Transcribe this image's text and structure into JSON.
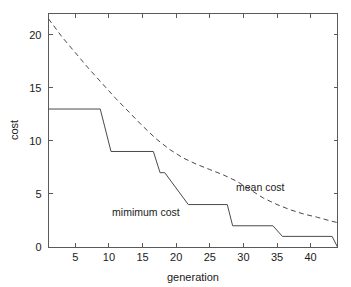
{
  "chart_data": {
    "type": "line",
    "title": "",
    "xlabel": "generation",
    "ylabel": "cost",
    "xlim": [
      1,
      44
    ],
    "ylim": [
      0,
      22
    ],
    "grid": false,
    "legend_position": "inline-annotations",
    "xticks": [
      5,
      10,
      15,
      20,
      25,
      30,
      35,
      40
    ],
    "xtick_labels": [
      "5",
      "10",
      "15",
      "20",
      "25",
      "30",
      "35",
      "40"
    ],
    "yticks": [
      0,
      5,
      10,
      15,
      20
    ],
    "ytick_labels": [
      "0",
      "5",
      "10",
      "15",
      "20"
    ],
    "series": [
      {
        "name": "mimimum cost",
        "style": "solid",
        "annotation": "mimimum cost",
        "annotation_x": 15.5,
        "annotation_y": 2.9,
        "x": [
          1,
          8.7,
          10.3,
          16.6,
          17.6,
          18.3,
          21.8,
          27.6,
          28.4,
          34.4,
          35.8,
          43.2,
          44
        ],
        "y": [
          13,
          13,
          9,
          9,
          7,
          7,
          4,
          4,
          2,
          2,
          1,
          1,
          0
        ]
      },
      {
        "name": "mean cost",
        "style": "dashed",
        "annotation": "mean cost",
        "annotation_x": 32.5,
        "annotation_y": 5.3,
        "x": [
          1,
          3,
          5,
          7,
          9,
          11,
          13,
          15,
          17,
          19,
          21,
          23,
          25,
          27,
          29,
          31,
          33,
          35,
          37,
          39,
          41,
          43,
          44
        ],
        "y": [
          21.5,
          19.8,
          18.3,
          16.8,
          15.4,
          14.0,
          12.7,
          11.4,
          10.2,
          9.2,
          8.4,
          7.8,
          7.3,
          6.8,
          6.2,
          5.4,
          4.6,
          4.0,
          3.5,
          3.1,
          2.8,
          2.45,
          2.3
        ]
      }
    ]
  }
}
